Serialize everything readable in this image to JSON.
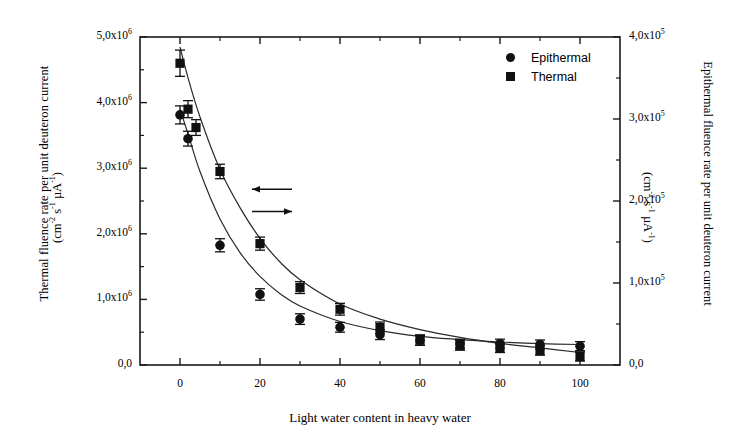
{
  "chart_data": {
    "type": "scatter",
    "title": "",
    "xlabel": "Light water content in heavy water",
    "ylabel_left_line1": "Thermal fluence rate per unit deuteron current",
    "ylabel_left_line2": "(cm⁻² s⁻¹ µA⁻¹)",
    "ylabel_right_line1": "Epithermal fluence rate per unit deuteron current",
    "ylabel_right_line2": "(cm⁻² s⁻¹ µA⁻¹)",
    "xlim": [
      -10,
      110
    ],
    "ylim_left": [
      0,
      5000000
    ],
    "ylim_right": [
      0,
      400000
    ],
    "grid": false,
    "legend_position": "top-right",
    "x_ticks": [
      0,
      20,
      40,
      60,
      80,
      100
    ],
    "x_tick_labels": [
      "0",
      "20",
      "40",
      "60",
      "80",
      "100"
    ],
    "x_minor_ticks": [
      10,
      30,
      50,
      70,
      90
    ],
    "y_left_ticks": [
      0,
      1000000,
      2000000,
      3000000,
      4000000,
      5000000
    ],
    "y_left_tick_labels": [
      "0,0",
      "1,0x10|6",
      "2,0x10|6",
      "3,0x10|6",
      "4,0x10|6",
      "5,0x10|6"
    ],
    "y_left_minor_ticks": [
      500000,
      1500000,
      2500000,
      3500000,
      4500000
    ],
    "y_right_ticks": [
      0,
      100000,
      200000,
      300000,
      400000
    ],
    "y_right_tick_labels": [
      "0,0",
      "1,0x10|5",
      "2,0x10|5",
      "3,0x10|5",
      "4,0x10|5"
    ],
    "y_right_minor_ticks": [
      50000,
      150000,
      250000,
      350000
    ],
    "series": [
      {
        "name": "Thermal",
        "marker": "square",
        "axis": "left",
        "color": "#111111",
        "x": [
          0,
          2,
          4,
          10,
          20,
          30,
          40,
          50,
          60,
          70,
          80,
          90,
          100
        ],
        "values": [
          4600000,
          3900000,
          3620000,
          2950000,
          1850000,
          1180000,
          850000,
          570000,
          380000,
          300000,
          260000,
          220000,
          130000
        ],
        "yerr": [
          200000,
          130000,
          120000,
          110000,
          100000,
          90000,
          90000,
          85000,
          80000,
          75000,
          70000,
          70000,
          70000
        ]
      },
      {
        "name": "Epithermal",
        "marker": "circle",
        "axis": "right",
        "color": "#111111",
        "x": [
          0,
          2,
          10,
          20,
          30,
          40,
          50,
          60,
          70,
          80,
          90,
          100
        ],
        "values": [
          305000,
          276000,
          146000,
          86000,
          56000,
          46000,
          37000,
          30000,
          26000,
          26000,
          25000,
          23000
        ],
        "yerr": [
          11000,
          9000,
          8000,
          7000,
          6500,
          6000,
          6000,
          6000,
          5500,
          5500,
          5500,
          5500
        ]
      }
    ],
    "fit_curves": [
      {
        "name": "Thermal fit",
        "axis": "left",
        "x": [
          0,
          2,
          5,
          10,
          15,
          20,
          25,
          30,
          40,
          50,
          60,
          70,
          80,
          90,
          100
        ],
        "values": [
          4850000,
          4380000,
          3780000,
          2980000,
          2400000,
          1930000,
          1570000,
          1300000,
          930000,
          700000,
          540000,
          420000,
          330000,
          260000,
          190000
        ]
      },
      {
        "name": "Epithermal fit",
        "axis": "right",
        "x": [
          0,
          2,
          5,
          10,
          15,
          20,
          25,
          30,
          40,
          50,
          60,
          70,
          80,
          90,
          100
        ],
        "values": [
          312000,
          282000,
          236000,
          178000,
          137000,
          108000,
          87000,
          72000,
          53000,
          42000,
          35000,
          31000,
          28000,
          26000,
          25000
        ]
      }
    ],
    "annotations": [
      {
        "name": "arrow-to-left-axis",
        "direction": "left",
        "x_start": 28,
        "x_end": 18,
        "y_left": 2680000
      },
      {
        "name": "arrow-to-right-axis",
        "direction": "right",
        "x_start": 18,
        "x_end": 28,
        "y_left": 2340000
      }
    ]
  },
  "legend": {
    "items": [
      {
        "label": "Epithermal",
        "marker": "circle"
      },
      {
        "label": "Thermal",
        "marker": "square"
      }
    ]
  }
}
